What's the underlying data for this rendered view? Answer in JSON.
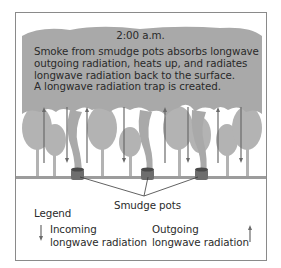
{
  "diagram": {
    "time_label": "2:00 a.m.",
    "caption_lines": [
      "Smoke from smudge pots absorbs longwave",
      "outgoing radiation, heats up, and radiates",
      "longwave radiation back to the surface.",
      "A longwave radiation trap is created."
    ],
    "pots_label": "Smudge pots",
    "legend": {
      "title": "Legend",
      "incoming": {
        "line1": "Incoming",
        "line2": "longwave radiation",
        "icon": "down-arrow-icon"
      },
      "outgoing": {
        "line1": "Outgoing",
        "line2": "longwave radiation",
        "icon": "up-arrow-icon"
      }
    },
    "colors": {
      "smoke": "#a9a9a9",
      "trees": "#b3b3b3",
      "ground": "#9c9c9c",
      "pot": "#6e6e6e",
      "arrow": "#6a6a6a",
      "border": "#8a8a8a"
    }
  }
}
